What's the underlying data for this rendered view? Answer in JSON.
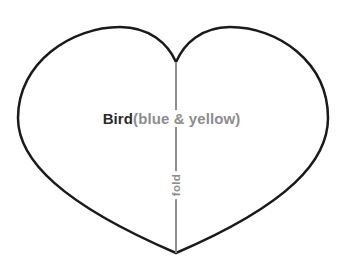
{
  "canvas": {
    "width": 343,
    "height": 265,
    "background_color": "#ffffff"
  },
  "pattern": {
    "shape_name": "heart",
    "outline_color": "#1a1a1a",
    "outline_width": 2.5,
    "fill_color": "none",
    "bounds": {
      "left": 18,
      "top": 27,
      "right": 328,
      "bottom": 253
    },
    "cleft_point": {
      "x": 176,
      "y": 62
    },
    "bottom_point": {
      "x": 176,
      "y": 253
    }
  },
  "fold_line": {
    "color": "#8d8d8d",
    "width": 2,
    "x": 176,
    "y_start": 62,
    "y_end": 253,
    "label": "fold",
    "label_color": "#8d8d8d",
    "label_rotation_degrees": -90,
    "label_center": {
      "x": 176,
      "y": 185
    }
  },
  "labels": {
    "piece_name": "Bird",
    "piece_name_color": "#2b2b2b",
    "color_note": "(blue & yellow)",
    "color_note_color": "#8d8d8d",
    "baseline_y": 119
  }
}
